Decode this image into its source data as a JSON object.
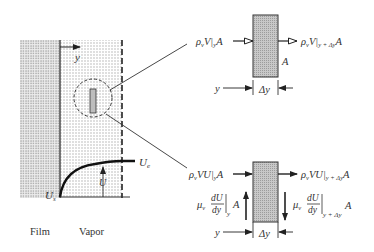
{
  "diagram": {
    "left_panel": {
      "axis_label": "y",
      "region_labels": {
        "film": "Film",
        "vapor": "Vapor"
      },
      "velocity_labels": {
        "edge": "U",
        "edge_sub": "e",
        "surface": "U",
        "surface_sub": "s",
        "local": "U"
      }
    },
    "mass_element": {
      "inflow": {
        "base": "ρ",
        "sub": "v",
        "mid": "V|",
        "sub2": "y",
        "tail": "A"
      },
      "outflow": {
        "base": "ρ",
        "sub": "v",
        "mid": "V|",
        "sub2": "y + Δy",
        "tail": "A"
      },
      "area_label": "A",
      "position_label": "y",
      "width_label": "Δy"
    },
    "momentum_element": {
      "inflow": {
        "base": "ρ",
        "sub": "v",
        "mid": "VU|",
        "sub2": "y",
        "tail": "A"
      },
      "outflow": {
        "base": "ρ",
        "sub": "v",
        "mid": "VU|",
        "sub2": "y + Δy",
        "tail": "A"
      },
      "shear_left": {
        "mu": "μ",
        "sub": "v",
        "num": "dU",
        "den": "dy",
        "eval": "y",
        "tail": "A"
      },
      "shear_right": {
        "mu": "μ",
        "sub": "v",
        "num": "dU",
        "den": "dy",
        "eval": "y + Δy",
        "tail": "A"
      },
      "position_label": "y",
      "width_label": "Δy"
    },
    "colors": {
      "ink": "#222222",
      "hatch": "#b5b5b5",
      "background": "#ffffff"
    }
  }
}
